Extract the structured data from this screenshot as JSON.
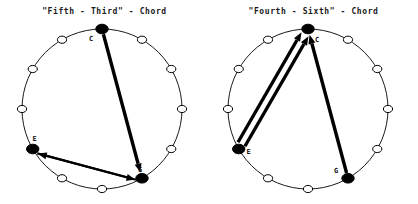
{
  "figure": {
    "background_color": "#ffffff",
    "ink_color": "#000000",
    "width": 418,
    "height": 204,
    "panel_count": 2
  },
  "panels": [
    {
      "id": "fifth-third",
      "title": "\"Fifth - Third\" - Chord",
      "circle": {
        "cx": 102,
        "cy": 109,
        "r": 80,
        "positions": 12
      },
      "nodes": [
        {
          "name": "C",
          "label": "C",
          "clock": 0,
          "filled": true,
          "label_dx": -11,
          "label_dy": 12
        },
        {
          "name": "pos-1",
          "label": "",
          "clock": 1,
          "filled": false,
          "label_dx": 0,
          "label_dy": 0
        },
        {
          "name": "pos-2",
          "label": "",
          "clock": 2,
          "filled": false,
          "label_dx": 0,
          "label_dy": 0
        },
        {
          "name": "pos-3",
          "label": "",
          "clock": 3,
          "filled": false,
          "label_dx": 0,
          "label_dy": 0
        },
        {
          "name": "pos-4",
          "label": "",
          "clock": 4,
          "filled": false,
          "label_dx": 0,
          "label_dy": 0
        },
        {
          "name": "G",
          "label": "G",
          "clock": 5,
          "filled": true,
          "label_dx": -2,
          "label_dy": -6
        },
        {
          "name": "pos-6",
          "label": "",
          "clock": 6,
          "filled": false,
          "label_dx": 0,
          "label_dy": 0
        },
        {
          "name": "pos-7",
          "label": "",
          "clock": 7,
          "filled": false,
          "label_dx": 0,
          "label_dy": 0
        },
        {
          "name": "E",
          "label": "E",
          "clock": 8,
          "filled": true,
          "label_dx": 2,
          "label_dy": -8
        },
        {
          "name": "pos-9",
          "label": "",
          "clock": 9,
          "filled": false,
          "label_dx": 0,
          "label_dy": 0
        },
        {
          "name": "pos-10",
          "label": "",
          "clock": 10,
          "filled": false,
          "label_dx": 0,
          "label_dy": 0
        },
        {
          "name": "pos-11",
          "label": "",
          "clock": 11,
          "filled": false,
          "label_dx": 0,
          "label_dy": 0
        }
      ],
      "arrows": [
        {
          "name": "arrow-c-to-g",
          "from": "C",
          "to": "G",
          "style": "thick",
          "offset": 0
        },
        {
          "name": "arrow-g-to-e",
          "from": "G",
          "to": "E",
          "style": "medium",
          "offset": -3
        },
        {
          "name": "arrow-e-to-g",
          "from": "E",
          "to": "G",
          "style": "medium",
          "offset": 3
        }
      ]
    },
    {
      "id": "fourth-sixth",
      "title": "\"Fourth - Sixth\" - Chord",
      "circle": {
        "cx": 99,
        "cy": 109,
        "r": 80,
        "positions": 12
      },
      "nodes": [
        {
          "name": "C",
          "label": "C",
          "clock": 0,
          "filled": true,
          "label_dx": 9,
          "label_dy": 13
        },
        {
          "name": "pos-1",
          "label": "",
          "clock": 1,
          "filled": false,
          "label_dx": 0,
          "label_dy": 0
        },
        {
          "name": "pos-2",
          "label": "",
          "clock": 2,
          "filled": false,
          "label_dx": 0,
          "label_dy": 0
        },
        {
          "name": "pos-3",
          "label": "",
          "clock": 3,
          "filled": false,
          "label_dx": 0,
          "label_dy": 0
        },
        {
          "name": "pos-4",
          "label": "",
          "clock": 4,
          "filled": false,
          "label_dx": 0,
          "label_dy": 0
        },
        {
          "name": "G",
          "label": "G",
          "clock": 5,
          "filled": true,
          "label_dx": -12,
          "label_dy": -5
        },
        {
          "name": "pos-6",
          "label": "",
          "clock": 6,
          "filled": false,
          "label_dx": 0,
          "label_dy": 0
        },
        {
          "name": "pos-7",
          "label": "",
          "clock": 7,
          "filled": false,
          "label_dx": 0,
          "label_dy": 0
        },
        {
          "name": "E",
          "label": "E",
          "clock": 8,
          "filled": true,
          "label_dx": 10,
          "label_dy": 5
        },
        {
          "name": "pos-9",
          "label": "",
          "clock": 9,
          "filled": false,
          "label_dx": 0,
          "label_dy": 0
        },
        {
          "name": "pos-10",
          "label": "",
          "clock": 10,
          "filled": false,
          "label_dx": 0,
          "label_dy": 0
        },
        {
          "name": "pos-11",
          "label": "",
          "clock": 11,
          "filled": false,
          "label_dx": 0,
          "label_dy": 0
        }
      ],
      "arrows": [
        {
          "name": "arrow-e-to-c-outer",
          "from": "E",
          "to": "C",
          "style": "thick",
          "offset": -4
        },
        {
          "name": "arrow-e-to-c-inner",
          "from": "E",
          "to": "C",
          "style": "thick",
          "offset": 4
        },
        {
          "name": "arrow-g-to-c",
          "from": "G",
          "to": "C",
          "style": "thick",
          "offset": 0
        }
      ]
    }
  ],
  "node_style": {
    "open_rx": 4.6,
    "open_ry": 3.6,
    "filled_rx": 6.2,
    "filled_ry": 4.8,
    "outline_width": 1
  },
  "line_style": {
    "thick_width": 3.4,
    "medium_width": 2.2,
    "circle_width": 0.9,
    "arrowhead_length": 9,
    "arrowhead_width": 7
  }
}
